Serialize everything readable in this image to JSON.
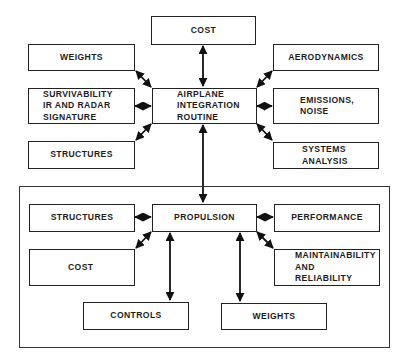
{
  "diagram": {
    "top_group": {
      "hub": {
        "label_lines": [
          "AIRPLANE",
          "INTEGRATION",
          "ROUTINE"
        ]
      },
      "cost": {
        "label": "COST"
      },
      "weights": {
        "label": "WEIGHTS"
      },
      "survivability": {
        "label_lines": [
          "SURVIVABILITY",
          "IR AND RADAR",
          "SIGNATURE"
        ]
      },
      "structures": {
        "label": "STRUCTURES"
      },
      "aerodynamics": {
        "label": "AERODYNAMICS"
      },
      "emissions": {
        "label_lines": [
          "EMISSIONS,",
          "NOISE"
        ]
      },
      "systems": {
        "label_lines": [
          "SYSTEMS",
          "ANALYSIS"
        ]
      }
    },
    "bottom_group": {
      "hub": {
        "label": "PROPULSION"
      },
      "structures": {
        "label": "STRUCTURES"
      },
      "cost": {
        "label": "COST"
      },
      "controls": {
        "label": "CONTROLS"
      },
      "performance": {
        "label": "PERFORMANCE"
      },
      "maintainability": {
        "label_lines": [
          "MAINTAINABILITY",
          "AND",
          "RELIABILITY"
        ]
      },
      "weights": {
        "label": "WEIGHTS"
      }
    },
    "connections": [
      [
        "AIRPLANE INTEGRATION ROUTINE",
        "COST"
      ],
      [
        "AIRPLANE INTEGRATION ROUTINE",
        "WEIGHTS"
      ],
      [
        "AIRPLANE INTEGRATION ROUTINE",
        "SURVIVABILITY IR AND RADAR SIGNATURE"
      ],
      [
        "AIRPLANE INTEGRATION ROUTINE",
        "STRUCTURES"
      ],
      [
        "AIRPLANE INTEGRATION ROUTINE",
        "AERODYNAMICS"
      ],
      [
        "AIRPLANE INTEGRATION ROUTINE",
        "EMISSIONS, NOISE"
      ],
      [
        "AIRPLANE INTEGRATION ROUTINE",
        "SYSTEMS ANALYSIS"
      ],
      [
        "AIRPLANE INTEGRATION ROUTINE",
        "PROPULSION"
      ],
      [
        "PROPULSION",
        "STRUCTURES"
      ],
      [
        "PROPULSION",
        "COST"
      ],
      [
        "PROPULSION",
        "CONTROLS"
      ],
      [
        "PROPULSION",
        "PERFORMANCE"
      ],
      [
        "PROPULSION",
        "MAINTAINABILITY AND RELIABILITY"
      ],
      [
        "PROPULSION",
        "WEIGHTS"
      ]
    ]
  }
}
